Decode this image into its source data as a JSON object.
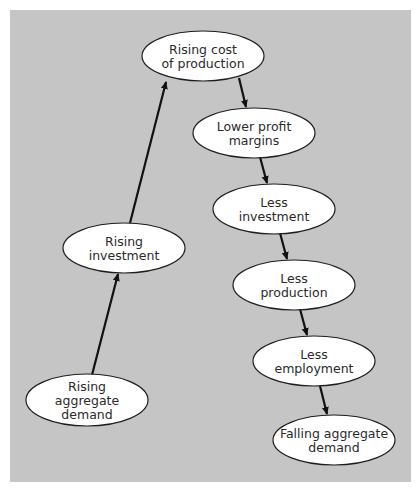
{
  "diagram": {
    "title": "",
    "colors": {
      "background": "#c5c5c5",
      "node_fill": "#ffffff",
      "node_stroke": "#1e1e1e",
      "arrow": "#111111",
      "text": "#2a2a2a"
    },
    "nodes": [
      {
        "id": "rising-cost",
        "lines": [
          "Rising cost",
          "of production"
        ]
      },
      {
        "id": "lower-profit",
        "lines": [
          "Lower profit",
          "margins"
        ]
      },
      {
        "id": "less-investment",
        "lines": [
          "Less",
          "investment"
        ]
      },
      {
        "id": "less-production",
        "lines": [
          "Less",
          "production"
        ]
      },
      {
        "id": "less-employment",
        "lines": [
          "Less",
          "employment"
        ]
      },
      {
        "id": "falling-demand",
        "lines": [
          "Falling aggregate",
          "demand"
        ]
      },
      {
        "id": "rising-investment",
        "lines": [
          "Rising",
          "investment"
        ]
      },
      {
        "id": "rising-demand",
        "lines": [
          "Rising",
          "aggregate",
          "demand"
        ]
      }
    ],
    "edges": [
      {
        "from": "rising-demand",
        "to": "rising-investment"
      },
      {
        "from": "rising-investment",
        "to": "rising-cost"
      },
      {
        "from": "rising-cost",
        "to": "lower-profit"
      },
      {
        "from": "lower-profit",
        "to": "less-investment"
      },
      {
        "from": "less-investment",
        "to": "less-production"
      },
      {
        "from": "less-production",
        "to": "less-employment"
      },
      {
        "from": "less-employment",
        "to": "falling-demand"
      }
    ]
  }
}
